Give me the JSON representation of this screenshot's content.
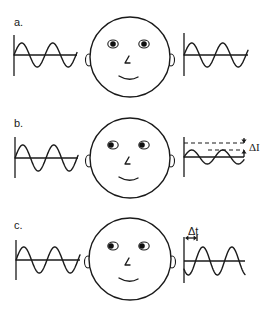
{
  "figure": {
    "background": "#ffffff",
    "ink": "#1a1a1a",
    "panels": [
      {
        "id": "a",
        "label": "a.",
        "label_pos": [
          14,
          26
        ],
        "face": {
          "cx": 130,
          "cy": 57,
          "r": 40,
          "pupil_offset": 0
        },
        "left_wave": {
          "axis_x": 14,
          "axis_top": 35,
          "axis_bottom": 76,
          "baseline_y": 55,
          "x_end": 77,
          "amplitude": 12,
          "period": 31,
          "phase": 0
        },
        "right_wave": {
          "axis_x": 184,
          "axis_top": 33,
          "axis_bottom": 76,
          "baseline_y": 55,
          "x_end": 248,
          "amplitude": 12,
          "period": 31,
          "phase": 0
        },
        "annotation": null
      },
      {
        "id": "b",
        "label": "b.",
        "label_pos": [
          14,
          127
        ],
        "face": {
          "cx": 130,
          "cy": 158,
          "r": 40,
          "pupil_offset": -2
        },
        "left_wave": {
          "axis_x": 15,
          "axis_top": 137,
          "axis_bottom": 178,
          "baseline_y": 158,
          "x_end": 78,
          "amplitude": 13,
          "period": 31,
          "phase": 0
        },
        "right_wave": {
          "axis_x": 184,
          "axis_top": 137,
          "axis_bottom": 177,
          "baseline_y": 157,
          "x_end": 244,
          "amplitude": 7,
          "period": 31,
          "phase": 0
        },
        "annotation": {
          "type": "intensity-difference",
          "symbol": "ΔI",
          "upper_dash_y": 143,
          "lower_dash_y": 150,
          "arrow_x": 244,
          "symbol_pos": [
            249,
            151
          ]
        }
      },
      {
        "id": "c",
        "label": "c.",
        "label_pos": [
          14,
          229
        ],
        "face": {
          "cx": 130,
          "cy": 259,
          "r": 41,
          "pupil_offset": -2
        },
        "left_wave": {
          "axis_x": 16,
          "axis_top": 240,
          "axis_bottom": 280,
          "baseline_y": 260,
          "x_end": 80,
          "amplitude": 13,
          "period": 31,
          "phase": 0
        },
        "right_wave": {
          "axis_x": 184,
          "axis_top": 237,
          "axis_bottom": 283,
          "baseline_y": 261,
          "x_end": 245,
          "amplitude": 14,
          "period": 29,
          "phase": -0.4
        },
        "annotation": {
          "type": "time-difference",
          "symbol": "Δt",
          "arrow_y": 238,
          "arrow_x1": 185,
          "arrow_x2": 197,
          "symbol_pos": [
            188,
            235
          ]
        }
      }
    ]
  }
}
